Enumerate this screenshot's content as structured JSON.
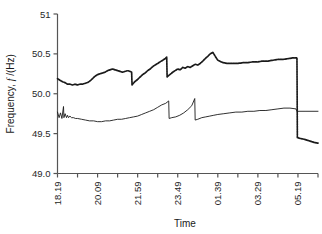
{
  "figure": {
    "background": "#ffffff",
    "axis_color": "#555555",
    "series_color": "#1a1a1a"
  },
  "chart_data": {
    "type": "line",
    "title": "",
    "xlabel": "Time",
    "ylabel_main": "Frequency,",
    "ylabel_symbol": "f",
    "ylabel_unit": "/(Hz)",
    "ylim": [
      49.0,
      51.0
    ],
    "yticks": [
      49.0,
      49.5,
      50.0,
      50.5,
      51
    ],
    "ytick_labels": [
      "49.0",
      "49.5",
      "50.0",
      "50.5",
      "51"
    ],
    "grid": false,
    "legend": "none",
    "xlim": [
      0,
      13
    ],
    "xticks_major": [
      0,
      2,
      4,
      6,
      8,
      10,
      12
    ],
    "xtick_labels": [
      "18.19",
      "20.09",
      "21.59",
      "23.49",
      "01.39",
      "03.29",
      "05.19"
    ],
    "xticks_minor": [
      1,
      3,
      5,
      7,
      9,
      11,
      13
    ],
    "series": [
      {
        "name": "upper-trace",
        "style": "dotted-thick",
        "x": [
          0.0,
          0.12,
          0.25,
          0.37,
          0.5,
          0.62,
          0.75,
          0.87,
          1.0,
          1.12,
          1.25,
          1.37,
          1.5,
          1.62,
          1.75,
          1.87,
          2.0,
          2.12,
          2.25,
          2.37,
          2.5,
          2.62,
          2.75,
          2.87,
          3.0,
          3.12,
          3.25,
          3.37,
          3.5,
          3.62,
          3.7,
          3.72,
          3.85,
          4.0,
          4.12,
          4.25,
          4.37,
          4.5,
          4.62,
          4.75,
          4.87,
          5.0,
          5.12,
          5.25,
          5.37,
          5.45,
          5.47,
          5.6,
          5.75,
          5.87,
          6.0,
          6.12,
          6.25,
          6.37,
          6.5,
          6.62,
          6.75,
          6.87,
          7.0,
          7.12,
          7.25,
          7.37,
          7.5,
          7.62,
          7.75,
          7.87,
          8.0,
          8.25,
          8.5,
          8.75,
          9.0,
          9.25,
          9.5,
          9.75,
          10.0,
          10.25,
          10.5,
          10.75,
          11.0,
          11.25,
          11.5,
          11.75,
          11.95,
          11.97,
          12.1,
          12.3,
          12.55,
          12.8,
          13.0
        ],
        "y": [
          50.19,
          50.17,
          50.15,
          50.14,
          50.12,
          50.12,
          50.11,
          50.12,
          50.11,
          50.12,
          50.12,
          50.13,
          50.14,
          50.16,
          50.19,
          50.22,
          50.24,
          50.25,
          50.26,
          50.27,
          50.29,
          50.3,
          50.31,
          50.3,
          50.29,
          50.28,
          50.27,
          50.28,
          50.29,
          50.28,
          50.27,
          50.11,
          50.15,
          50.18,
          50.21,
          50.24,
          50.26,
          50.29,
          50.31,
          50.34,
          50.36,
          50.38,
          50.4,
          50.42,
          50.44,
          50.46,
          50.21,
          50.24,
          50.27,
          50.29,
          50.31,
          50.3,
          50.33,
          50.32,
          50.34,
          50.33,
          50.35,
          50.37,
          50.36,
          50.38,
          50.41,
          50.44,
          50.47,
          50.5,
          50.52,
          50.47,
          50.42,
          50.39,
          50.38,
          50.38,
          50.38,
          50.39,
          50.39,
          50.4,
          50.4,
          50.41,
          50.41,
          50.42,
          50.43,
          50.43,
          50.44,
          50.45,
          50.45,
          49.45,
          49.44,
          49.43,
          49.41,
          49.39,
          49.38
        ]
      },
      {
        "name": "lower-trace",
        "style": "thin",
        "x": [
          0.0,
          0.08,
          0.15,
          0.22,
          0.3,
          0.32,
          0.38,
          0.45,
          0.5,
          0.55,
          0.62,
          0.7,
          0.8,
          0.9,
          1.0,
          1.2,
          1.4,
          1.6,
          1.8,
          2.0,
          2.2,
          2.4,
          2.6,
          2.8,
          3.0,
          3.2,
          3.4,
          3.6,
          3.8,
          4.0,
          4.2,
          4.4,
          4.6,
          4.8,
          5.0,
          5.2,
          5.4,
          5.55,
          5.57,
          5.7,
          5.9,
          6.1,
          6.3,
          6.5,
          6.7,
          6.85,
          6.87,
          7.0,
          7.2,
          7.4,
          7.6,
          7.8,
          8.0,
          8.3,
          8.6,
          8.9,
          9.2,
          9.5,
          9.8,
          10.1,
          10.4,
          10.7,
          11.0,
          11.3,
          11.6,
          11.9,
          11.95,
          12.1,
          12.4,
          12.7,
          13.0
        ],
        "y": [
          49.77,
          49.7,
          49.76,
          49.69,
          49.84,
          49.7,
          49.75,
          49.7,
          49.73,
          49.7,
          49.72,
          49.7,
          49.7,
          49.69,
          49.69,
          49.68,
          49.67,
          49.66,
          49.66,
          49.65,
          49.65,
          49.66,
          49.66,
          49.67,
          49.68,
          49.68,
          49.69,
          49.7,
          49.71,
          49.72,
          49.74,
          49.76,
          49.78,
          49.8,
          49.83,
          49.86,
          49.88,
          49.91,
          49.69,
          49.7,
          49.71,
          49.73,
          49.76,
          49.8,
          49.85,
          49.94,
          49.67,
          49.68,
          49.7,
          49.71,
          49.72,
          49.73,
          49.74,
          49.75,
          49.76,
          49.77,
          49.77,
          49.78,
          49.78,
          49.79,
          49.79,
          49.8,
          49.81,
          49.82,
          49.82,
          49.81,
          49.78,
          49.78,
          49.78,
          49.78,
          49.78
        ]
      }
    ]
  }
}
